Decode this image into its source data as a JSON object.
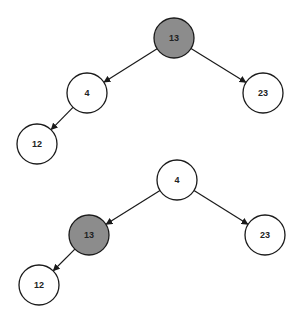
{
  "colors": {
    "highlight_fill": "#8c8c8c",
    "normal_fill": "#ffffff",
    "stroke": "#1a1a1a"
  },
  "trees": [
    {
      "name": "tree-before",
      "nodes": [
        {
          "id": "t1-n13",
          "label": "13",
          "cx": 174,
          "cy": 38,
          "highlighted": true
        },
        {
          "id": "t1-n4",
          "label": "4",
          "cx": 87,
          "cy": 93,
          "highlighted": false
        },
        {
          "id": "t1-n23",
          "label": "23",
          "cx": 263,
          "cy": 93,
          "highlighted": false
        },
        {
          "id": "t1-n12",
          "label": "12",
          "cx": 37,
          "cy": 144,
          "highlighted": false
        }
      ],
      "edges": [
        {
          "from": "t1-n13",
          "to": "t1-n4"
        },
        {
          "from": "t1-n13",
          "to": "t1-n23"
        },
        {
          "from": "t1-n4",
          "to": "t1-n12"
        }
      ]
    },
    {
      "name": "tree-after",
      "nodes": [
        {
          "id": "t2-n4",
          "label": "4",
          "cx": 177,
          "cy": 180,
          "highlighted": false
        },
        {
          "id": "t2-n13",
          "label": "13",
          "cx": 89,
          "cy": 235,
          "highlighted": true
        },
        {
          "id": "t2-n23",
          "label": "23",
          "cx": 265,
          "cy": 235,
          "highlighted": false
        },
        {
          "id": "t2-n12",
          "label": "12",
          "cx": 39,
          "cy": 285,
          "highlighted": false
        }
      ],
      "edges": [
        {
          "from": "t2-n4",
          "to": "t2-n13"
        },
        {
          "from": "t2-n4",
          "to": "t2-n23"
        },
        {
          "from": "t2-n13",
          "to": "t2-n12"
        }
      ]
    }
  ],
  "node_radius": 20
}
